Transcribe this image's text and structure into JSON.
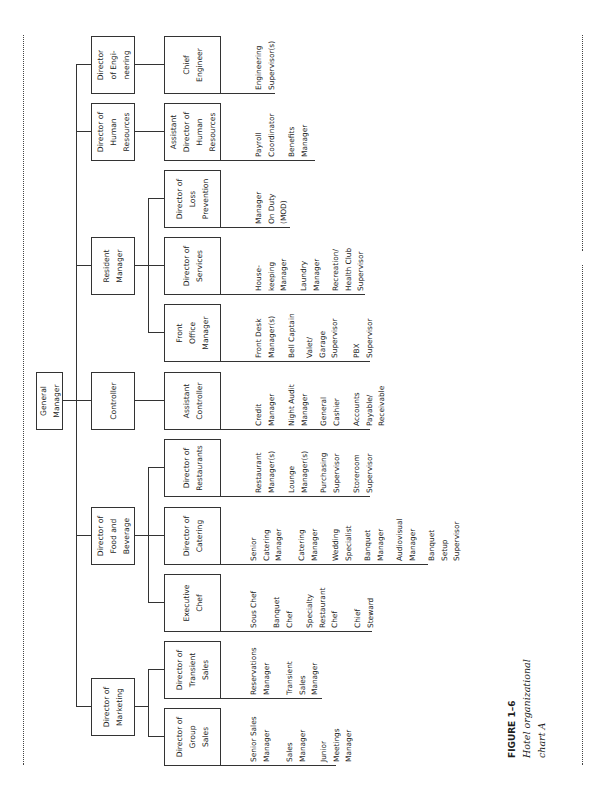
{
  "figure": {
    "label": "FIGURE 1–6",
    "title": "Hotel organizational\nchart A"
  },
  "chart": {
    "top": {
      "title": "General\nManager"
    },
    "level1": [
      {
        "title": "Director of\nMarketing"
      },
      {
        "title": "Director of\nFood and\nBeverage"
      },
      {
        "title": "Controller"
      },
      {
        "title": "Resident\nManager"
      },
      {
        "title": "Director of\nHuman\nResources"
      },
      {
        "title": "Director\nof Engi-\nneering"
      }
    ],
    "level2": [
      {
        "title": "Director of\nGroup\nSales",
        "reports": [
          "Senior Sales\nManager",
          "Sales\nManager",
          "Junior\nMeetings\nManager"
        ]
      },
      {
        "title": "Director of\nTransient\nSales",
        "reports": [
          "Reservations\nManager",
          "Transient\nSales\nManager"
        ]
      },
      {
        "title": "Executive\nChef",
        "reports": [
          "Sous Chef",
          "Banquet\nChef",
          "Specialty\nRestaurant\nChef",
          "Chief\nSteward"
        ]
      },
      {
        "title": "Director of\nCatering",
        "reports": [
          "Senior\nCatering\nManager",
          "Catering\nManager",
          "Wedding\nSpecialist",
          "Banquet\nManager",
          "Audiovisual\nManager",
          "Banquet\nSetup\nSupervisor"
        ]
      },
      {
        "title": "Director of\nRestaurants",
        "reports": [
          "Restaurant\nManager(s)",
          "Lounge\nManager(s)",
          "Purchasing\nSupervisor",
          "Storeroom\nSupervisor"
        ]
      },
      {
        "title": "Assistant\nController",
        "reports": [
          "Credit\nManager",
          "Night Audit\nManager",
          "General\nCashier",
          "Accounts\nPayable/\nReceivable"
        ]
      },
      {
        "title": "Front\nOffice\nManager",
        "reports": [
          "Front Desk\nManager(s)",
          "Bell Captain",
          "Valet/\nGarage\nSupervisor",
          "PBX\nSupervisor"
        ]
      },
      {
        "title": "Director of\nServices",
        "reports": [
          "House-\nkeeping\nManager",
          "Laundry\nManager",
          "Recreation/\nHealth Club\nSupervisor"
        ]
      },
      {
        "title": "Director of\nLoss\nPrevention",
        "reports": [
          "Manager\nOn Duty\n(MOD)"
        ]
      },
      {
        "title": "Assistant\nDirector of\nHuman\nResources",
        "reports": [
          "Payroll\nCoordinator",
          "Benefits\nManager"
        ]
      },
      {
        "title": "Chief\nEngineer",
        "reports": [
          "Engineering\nSupervisor(s)"
        ]
      }
    ]
  }
}
